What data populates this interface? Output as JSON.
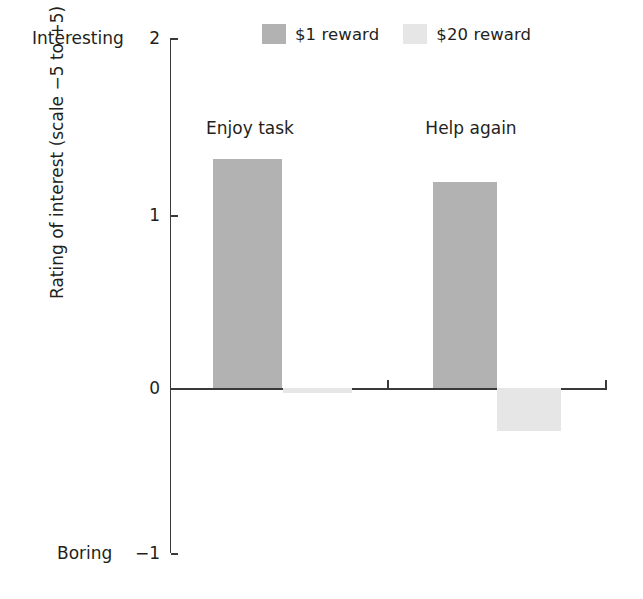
{
  "chart_data": {
    "type": "bar",
    "title": "",
    "xlabel": "",
    "ylabel": "Rating of interest (scale −5 to +5)",
    "ylim": [
      -1,
      2
    ],
    "yticks": [
      2,
      1,
      0,
      -1
    ],
    "ytick_labels": [
      "2",
      "1",
      "0",
      "−1"
    ],
    "y_axis_top_anchor": "Interesting",
    "y_axis_bottom_anchor": "Boring",
    "grid": false,
    "legend_position": "top-center",
    "categories": [
      "Enjoy task",
      "Help again"
    ],
    "series": [
      {
        "name": "$1 reward",
        "color": "#b2b2b2",
        "values": [
          1.31,
          1.18
        ]
      },
      {
        "name": "$20 reward",
        "color": "#e6e6e6",
        "values": [
          -0.03,
          -0.26
        ]
      }
    ]
  },
  "legend": {
    "entries": [
      {
        "label": "$1 reward",
        "swatch": "#b2b2b2"
      },
      {
        "label": "$20 reward",
        "swatch": "#e6e6e6"
      }
    ]
  },
  "axis": {
    "y_title": "Rating of interest (scale −5 to +5)",
    "top_anchor": "Interesting",
    "bottom_anchor": "Boring",
    "tick_2": "2",
    "tick_1": "1",
    "tick_0": "0",
    "tick_neg1": "−1"
  },
  "groups": {
    "group1_title": "Enjoy task",
    "group2_title": "Help again"
  }
}
